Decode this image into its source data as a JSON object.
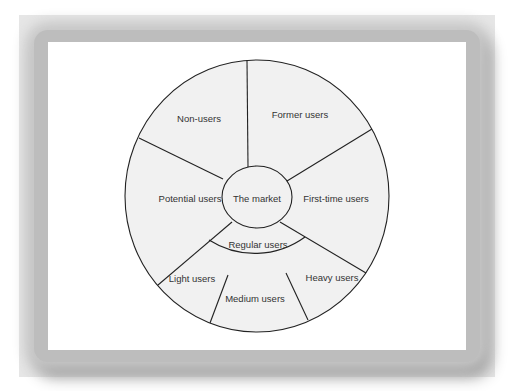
{
  "diagram": {
    "center": {
      "label": "The market"
    },
    "inner_ring": {
      "label": "Regular users"
    },
    "segments": [
      {
        "id": "non-users",
        "label": "Non-users"
      },
      {
        "id": "former-users",
        "label": "Former users"
      },
      {
        "id": "first-time-users",
        "label": "First-time users"
      },
      {
        "id": "heavy-users",
        "label": "Heavy users"
      },
      {
        "id": "medium-users",
        "label": "Medium users"
      },
      {
        "id": "light-users",
        "label": "Light users"
      },
      {
        "id": "potential-users",
        "label": "Potential users"
      }
    ],
    "colors": {
      "frame": "#e6e6e6",
      "panel": "#ffffff",
      "wheel_fill": "#f1f1f1",
      "line": "#222222",
      "text": "#333333"
    }
  }
}
